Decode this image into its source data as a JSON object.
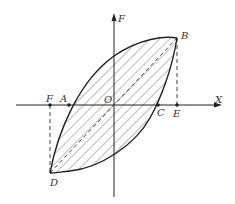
{
  "diagram": {
    "type": "hysteresis-loop",
    "axes": {
      "horizontal_label": "X",
      "vertical_label": "F",
      "origin_label": "O"
    },
    "points": {
      "A": "A",
      "B": "B",
      "C": "C",
      "D": "D",
      "E": "E",
      "F": "F"
    },
    "colors": {
      "stroke": "#222222",
      "hatch": "#555555",
      "dash": "#444444",
      "background": "#ffffff"
    }
  }
}
